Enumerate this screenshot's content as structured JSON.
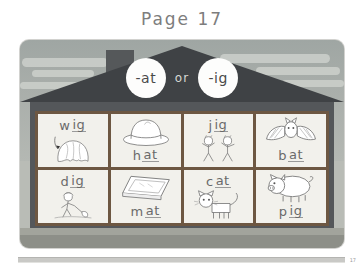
{
  "page": {
    "title": "Page 17",
    "footer_number": "17"
  },
  "worksheet": {
    "banner": {
      "left_rime": "-at",
      "conjunction": "or",
      "right_rime": "-ig"
    },
    "cells": [
      {
        "onset": "w",
        "rime": "ig",
        "picture": "wig-illustration",
        "text_position": "top"
      },
      {
        "onset": "h",
        "rime": "at",
        "picture": "hat-illustration",
        "text_position": "bottom"
      },
      {
        "onset": "j",
        "rime": "ig",
        "picture": "jig-dancers-illustration",
        "text_position": "top"
      },
      {
        "onset": "b",
        "rime": "at",
        "picture": "bat-illustration",
        "text_position": "bottom"
      },
      {
        "onset": "d",
        "rime": "ig",
        "picture": "digging-boy-illustration",
        "text_position": "top"
      },
      {
        "onset": "m",
        "rime": "at",
        "picture": "mat-illustration",
        "text_position": "bottom"
      },
      {
        "onset": "c",
        "rime": "at",
        "picture": "cat-illustration",
        "text_position": "top"
      },
      {
        "onset": "p",
        "rime": "ig",
        "picture": "pig-illustration",
        "text_position": "bottom"
      }
    ]
  },
  "colors": {
    "roof": "#3f4245",
    "house_body": "#54575a",
    "grid_border": "#6d5742",
    "cell_background": "#f2f1ec",
    "text": "#6a6a6a",
    "title": "#7d7d7d"
  }
}
